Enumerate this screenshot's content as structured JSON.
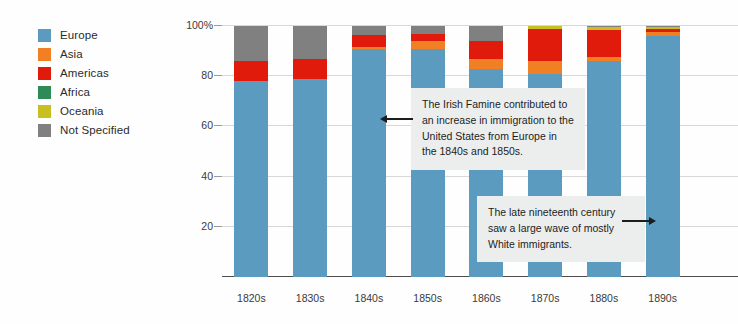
{
  "chart_data": {
    "type": "bar",
    "stacked": true,
    "normalized_percent": true,
    "title": "",
    "xlabel": "",
    "ylabel": "",
    "ylim": [
      0,
      100
    ],
    "grid": true,
    "legend_position": "left",
    "categories": [
      "1820s",
      "1830s",
      "1840s",
      "1850s",
      "1860s",
      "1870s",
      "1880s",
      "1890s"
    ],
    "series": [
      {
        "name": "Europe",
        "color": "#5b9bc0",
        "values": [
          78,
          79,
          91,
          91,
          83,
          81,
          86,
          96
        ]
      },
      {
        "name": "Asia",
        "color": "#f08023",
        "values": [
          0,
          0,
          0.5,
          3,
          4,
          5,
          1.5,
          1.5
        ]
      },
      {
        "name": "Americas",
        "color": "#e11b0c",
        "values": [
          8,
          8,
          5,
          3,
          7,
          13,
          11,
          1.3
        ]
      },
      {
        "name": "Africa",
        "color": "#2e8b57",
        "values": [
          0,
          0,
          0,
          0,
          0,
          0,
          0,
          0
        ]
      },
      {
        "name": "Oceania",
        "color": "#c8c020",
        "values": [
          0,
          0,
          0,
          0,
          0,
          1,
          1,
          0.9
        ]
      },
      {
        "name": "Not Specified",
        "color": "#808080",
        "values": [
          14,
          13,
          3.5,
          3,
          6,
          0,
          0.5,
          0.3
        ]
      }
    ],
    "yticks": [
      {
        "value": 100,
        "label": "100%"
      },
      {
        "value": 80,
        "label": "80"
      },
      {
        "value": 60,
        "label": "60"
      },
      {
        "value": 40,
        "label": "40"
      },
      {
        "value": 20,
        "label": "20"
      },
      {
        "value": 0,
        "label": ""
      }
    ],
    "annotations": [
      {
        "text": "The Irish Famine contributed to an increase in immigration to the United States from Europe in the 1840s and 1850s.",
        "arrow_direction": "left"
      },
      {
        "text": "The late nineteenth century saw a large wave of mostly White immigrants.",
        "arrow_direction": "right"
      }
    ]
  }
}
